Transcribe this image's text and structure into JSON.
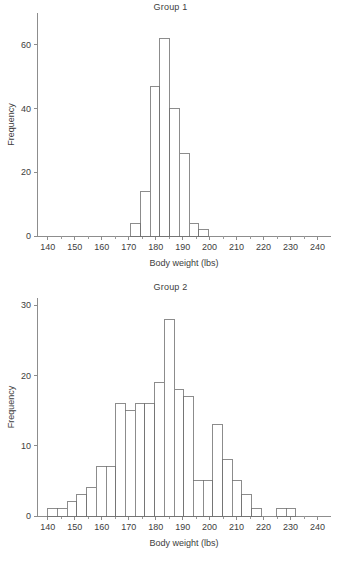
{
  "figure": {
    "background": "#ffffff",
    "line_color": "#6f6f6f",
    "axis_color": "#8d8d8d",
    "text_color": "#3d3d3d"
  },
  "panels": [
    {
      "id": "group-1",
      "title": "Group 1"
    },
    {
      "id": "group-2",
      "title": "Group 2"
    }
  ],
  "chart_data": [
    {
      "type": "bar",
      "title": "Group 1",
      "xlabel": "Body weight (lbs)",
      "ylabel": "Frequency",
      "xlim": [
        136,
        245
      ],
      "ylim": [
        0,
        70
      ],
      "xticks": [
        140,
        150,
        160,
        170,
        180,
        190,
        200,
        210,
        220,
        230,
        240
      ],
      "xtick_labels": [
        "140",
        "150",
        "160",
        "170",
        "180",
        "190",
        "200",
        "210",
        "220",
        "230",
        "240"
      ],
      "yticks": [
        0,
        20,
        40,
        60
      ],
      "ytick_labels": [
        "0",
        "20",
        "40",
        "60"
      ],
      "minor_xtick_step": 5,
      "grid": false,
      "legend": "none",
      "bin_width": 3.6,
      "bins": [
        {
          "x0": 170.8,
          "x1": 174.4,
          "value": 4
        },
        {
          "x0": 174.4,
          "x1": 178.0,
          "value": 14
        },
        {
          "x0": 178.0,
          "x1": 181.6,
          "value": 47
        },
        {
          "x0": 181.6,
          "x1": 185.2,
          "value": 62
        },
        {
          "x0": 185.2,
          "x1": 188.8,
          "value": 40
        },
        {
          "x0": 188.8,
          "x1": 192.4,
          "value": 26
        },
        {
          "x0": 192.4,
          "x1": 196.0,
          "value": 4
        },
        {
          "x0": 196.0,
          "x1": 199.6,
          "value": 2
        }
      ]
    },
    {
      "type": "bar",
      "title": "Group 2",
      "xlabel": "Body weight (lbs)",
      "ylabel": "Frequency",
      "xlim": [
        136,
        245
      ],
      "ylim": [
        0,
        31
      ],
      "xticks": [
        140,
        150,
        160,
        170,
        180,
        190,
        200,
        210,
        220,
        230,
        240
      ],
      "xtick_labels": [
        "140",
        "150",
        "160",
        "170",
        "180",
        "190",
        "200",
        "210",
        "220",
        "230",
        "240"
      ],
      "yticks": [
        0,
        10,
        20,
        30
      ],
      "ytick_labels": [
        "0",
        "10",
        "20",
        "30"
      ],
      "minor_xtick_step": 5,
      "grid": false,
      "legend": "none",
      "bin_width": 3.6,
      "bins": [
        {
          "x0": 140.0,
          "x1": 143.6,
          "value": 1
        },
        {
          "x0": 143.6,
          "x1": 147.2,
          "value": 1
        },
        {
          "x0": 147.2,
          "x1": 150.8,
          "value": 2
        },
        {
          "x0": 150.8,
          "x1": 154.4,
          "value": 3
        },
        {
          "x0": 154.4,
          "x1": 158.0,
          "value": 4
        },
        {
          "x0": 158.0,
          "x1": 161.6,
          "value": 7
        },
        {
          "x0": 161.6,
          "x1": 165.2,
          "value": 7
        },
        {
          "x0": 165.2,
          "x1": 168.8,
          "value": 16
        },
        {
          "x0": 168.8,
          "x1": 172.4,
          "value": 15
        },
        {
          "x0": 172.4,
          "x1": 176.0,
          "value": 16
        },
        {
          "x0": 176.0,
          "x1": 179.6,
          "value": 16
        },
        {
          "x0": 179.6,
          "x1": 183.2,
          "value": 19
        },
        {
          "x0": 183.2,
          "x1": 186.8,
          "value": 28
        },
        {
          "x0": 186.8,
          "x1": 190.4,
          "value": 18
        },
        {
          "x0": 190.4,
          "x1": 194.0,
          "value": 17
        },
        {
          "x0": 194.0,
          "x1": 197.6,
          "value": 5
        },
        {
          "x0": 197.6,
          "x1": 201.2,
          "value": 5
        },
        {
          "x0": 201.2,
          "x1": 204.8,
          "value": 13
        },
        {
          "x0": 204.8,
          "x1": 208.4,
          "value": 8
        },
        {
          "x0": 208.4,
          "x1": 212.0,
          "value": 5
        },
        {
          "x0": 212.0,
          "x1": 215.6,
          "value": 3
        },
        {
          "x0": 215.6,
          "x1": 219.2,
          "value": 1
        },
        {
          "x0": 224.8,
          "x1": 228.4,
          "value": 1
        },
        {
          "x0": 228.4,
          "x1": 232.0,
          "value": 1
        }
      ]
    }
  ]
}
